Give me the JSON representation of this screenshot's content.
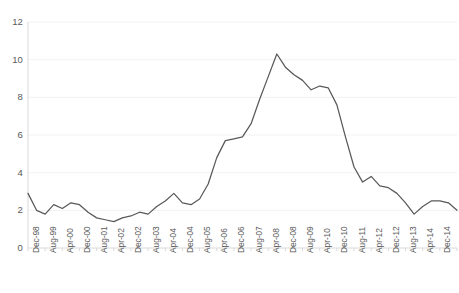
{
  "chart_data": {
    "type": "line",
    "title": "",
    "subtitle": "",
    "xlabel": "",
    "ylabel": "",
    "ylim": [
      0,
      12
    ],
    "yticks": [
      0,
      2,
      4,
      6,
      8,
      10,
      12
    ],
    "ytick_labels": [
      "0",
      "2",
      "4",
      "6",
      "8",
      "10",
      "12"
    ],
    "grid": true,
    "grid_axis": "y",
    "legend": false,
    "legend_position": "none",
    "line_color": "#595959",
    "grid_color": "#f2f2f2",
    "axis_color": "#d9d9d9",
    "text_color": "#5a5a5a",
    "xtick_labels": [
      "Dec-98",
      "Aug-99",
      "Apr-00",
      "Dec-00",
      "Aug-01",
      "Apr-02",
      "Dec-02",
      "Aug-03",
      "Apr-04",
      "Dec-04",
      "Aug-05",
      "Apr-06",
      "Dec-06",
      "Aug-07",
      "Apr-08",
      "Dec-08",
      "Aug-09",
      "Apr-10",
      "Dec-10",
      "Aug-11",
      "Apr-12",
      "Dec-12",
      "Aug-13",
      "Apr-14",
      "Dec-14",
      "Aug-15"
    ],
    "x": [
      "Dec-98",
      "Apr-99",
      "Aug-99",
      "Dec-99",
      "Apr-00",
      "Aug-00",
      "Dec-00",
      "Apr-01",
      "Aug-01",
      "Dec-01",
      "Apr-02",
      "Aug-02",
      "Dec-02",
      "Apr-03",
      "Aug-03",
      "Dec-03",
      "Apr-04",
      "Aug-04",
      "Dec-04",
      "Apr-05",
      "Aug-05",
      "Dec-05",
      "Apr-06",
      "Aug-06",
      "Dec-06",
      "Apr-07",
      "Aug-07",
      "Dec-07",
      "Apr-08",
      "Aug-08",
      "Dec-08",
      "Apr-09",
      "Aug-09",
      "Dec-09",
      "Apr-10",
      "Aug-10",
      "Dec-10",
      "Apr-11",
      "Aug-11",
      "Dec-11",
      "Apr-12",
      "Aug-12",
      "Dec-12",
      "Apr-13",
      "Aug-13",
      "Dec-13",
      "Apr-14",
      "Aug-14",
      "Dec-14",
      "Apr-15",
      "Aug-15"
    ],
    "values": [
      2.9,
      2.0,
      1.8,
      2.3,
      2.1,
      2.4,
      2.3,
      1.9,
      1.6,
      1.5,
      1.4,
      1.6,
      1.7,
      1.9,
      1.8,
      2.2,
      2.5,
      2.9,
      2.4,
      2.3,
      2.6,
      3.4,
      4.8,
      5.7,
      5.8,
      5.9,
      6.6,
      7.9,
      9.1,
      10.3,
      9.6,
      9.2,
      8.9,
      8.4,
      8.6,
      8.5,
      7.6,
      5.9,
      4.3,
      3.5,
      3.8,
      3.3,
      3.2,
      2.9,
      2.4,
      1.8,
      2.2,
      2.5,
      2.5,
      2.4,
      2.0
    ],
    "series": [
      {
        "name": "series-1",
        "color": "#595959",
        "values": [
          2.9,
          2.0,
          1.8,
          2.3,
          2.1,
          2.4,
          2.3,
          1.9,
          1.6,
          1.5,
          1.4,
          1.6,
          1.7,
          1.9,
          1.8,
          2.2,
          2.5,
          2.9,
          2.4,
          2.3,
          2.6,
          3.4,
          4.8,
          5.7,
          5.8,
          5.9,
          6.6,
          7.9,
          9.1,
          10.3,
          9.6,
          9.2,
          8.9,
          8.4,
          8.6,
          8.5,
          7.6,
          5.9,
          4.3,
          3.5,
          3.8,
          3.3,
          3.2,
          2.9,
          2.4,
          1.8,
          2.2,
          2.5,
          2.5,
          2.4,
          2.0
        ]
      }
    ]
  },
  "plot_geometry": {
    "left": 28,
    "right": 457,
    "top": 22,
    "bottom": 248
  }
}
